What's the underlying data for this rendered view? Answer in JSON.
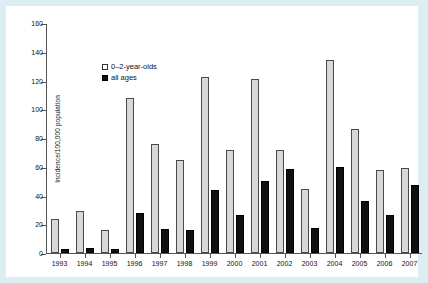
{
  "chart_data": {
    "type": "bar",
    "title": "",
    "xlabel": "",
    "ylabel": "Incidence/100,000 population",
    "ylim": [
      0,
      160
    ],
    "yticks": [
      0,
      20,
      40,
      60,
      80,
      100,
      120,
      140,
      160
    ],
    "grid": false,
    "legend_position": "top-left",
    "categories": [
      "1993",
      "1994",
      "1995",
      "1996",
      "1997",
      "1998",
      "1999",
      "2000",
      "2001",
      "2002",
      "2003",
      "2004",
      "2005",
      "2006",
      "2007"
    ],
    "series": [
      {
        "name": "0–2-year-olds",
        "color": "#d8d8d8",
        "values": [
          24,
          29.5,
          16,
          108,
          76,
          65,
          122.5,
          71.5,
          121,
          71.5,
          44.5,
          134,
          86.5,
          57.5,
          59
        ]
      },
      {
        "name": "all ages",
        "color": "#101010",
        "values": [
          2.5,
          3.5,
          2.5,
          27.5,
          17,
          16,
          44,
          26.5,
          50,
          58.5,
          17.5,
          59.5,
          36,
          26.5,
          47
        ]
      }
    ]
  },
  "legend": {
    "items": [
      {
        "label": "0–2-year-olds",
        "swatch": "light"
      },
      {
        "label": "all ages",
        "swatch": "dark"
      }
    ]
  },
  "colors": {
    "page_background": "#ddeef2",
    "canvas": "#ffffff",
    "axis": "#555555",
    "series_light": "#d8d8d8",
    "series_dark": "#101010"
  }
}
